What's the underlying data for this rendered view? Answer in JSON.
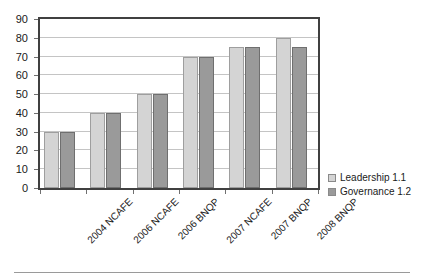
{
  "chart_data": {
    "type": "bar",
    "title": "",
    "subtitle": "",
    "xlabel": "",
    "ylabel": "",
    "ylim": [
      0,
      90
    ],
    "y_ticks": [
      0,
      10,
      20,
      30,
      40,
      50,
      60,
      70,
      80,
      90
    ],
    "grid": true,
    "legend_position": "right",
    "categories": [
      "2004 NCAFE",
      "2006 NCAFE",
      "2006 BNQP",
      "2007 NCAFE",
      "2007 BNQP",
      "2008 BNQP"
    ],
    "series": [
      {
        "name": "Leadership 1.1",
        "color": "#d4d4d4",
        "values": [
          30,
          40,
          50,
          70,
          75,
          80
        ]
      },
      {
        "name": "Governance 1.2",
        "color": "#9a9a9a",
        "values": [
          30,
          40,
          50,
          70,
          75,
          75
        ]
      }
    ]
  }
}
